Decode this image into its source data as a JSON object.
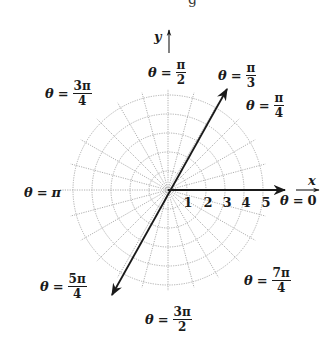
{
  "diagram": {
    "type": "polar-coordinate-grid",
    "center": {
      "x": 168,
      "y": 190
    },
    "radius_step_px": 19,
    "circle_count": 5,
    "radial_line_step_deg": 15,
    "grid_color": "#9a9a9a",
    "line_color": "#1a1a1a",
    "axes": {
      "x_label": "x",
      "y_label": "y"
    },
    "radial_ticks": [
      "1",
      "2",
      "3",
      "4",
      "5"
    ],
    "highlighted_ray": {
      "angle": "π/3",
      "extends_through_origin": true
    },
    "angle_labels": [
      {
        "id": "theta-0",
        "prefix": "θ",
        "eq": "=",
        "value": "0",
        "num": "",
        "den": ""
      },
      {
        "id": "theta-pi-4",
        "prefix": "θ",
        "eq": "=",
        "value": "",
        "num": "π",
        "den": "4"
      },
      {
        "id": "theta-pi-3",
        "prefix": "θ",
        "eq": "=",
        "value": "",
        "num": "π",
        "den": "3"
      },
      {
        "id": "theta-pi-2",
        "prefix": "θ",
        "eq": "=",
        "value": "",
        "num": "π",
        "den": "2"
      },
      {
        "id": "theta-3pi-4",
        "prefix": "θ",
        "eq": "=",
        "value": "",
        "num": "3π",
        "den": "4"
      },
      {
        "id": "theta-pi",
        "prefix": "θ",
        "eq": "=",
        "value": "π",
        "num": "",
        "den": ""
      },
      {
        "id": "theta-5pi-4",
        "prefix": "θ",
        "eq": "=",
        "value": "",
        "num": "5π",
        "den": "4"
      },
      {
        "id": "theta-3pi-2",
        "prefix": "θ",
        "eq": "=",
        "value": "",
        "num": "3π",
        "den": "2"
      },
      {
        "id": "theta-7pi-4",
        "prefix": "θ",
        "eq": "=",
        "value": "",
        "num": "7π",
        "den": "4"
      }
    ],
    "top_cutoff_glyph": "g"
  }
}
